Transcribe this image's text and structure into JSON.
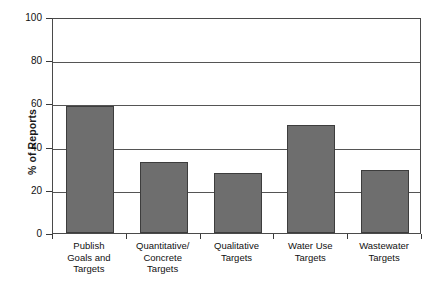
{
  "chart_data": {
    "type": "bar",
    "title": "",
    "xlabel": "",
    "ylabel": "% of Reports",
    "categories": [
      "Publish Goals and Targets",
      "Quantitative/ Concrete Targets",
      "Qualitative Targets",
      "Water Use Targets",
      "Wastewater Targets"
    ],
    "category_lines": [
      [
        "Publish",
        "Goals and",
        "Targets"
      ],
      [
        "Quantitative/",
        "Concrete",
        "Targets"
      ],
      [
        "Qualitative",
        "Targets"
      ],
      [
        "Water Use",
        "Targets"
      ],
      [
        "Wastewater",
        "Targets"
      ]
    ],
    "values": [
      59,
      33,
      28,
      50,
      29
    ],
    "ylim": [
      0,
      100
    ],
    "yticks": [
      0,
      20,
      40,
      60,
      80,
      100
    ],
    "ytick_labels": [
      "0",
      "20",
      "40",
      "60",
      "80",
      "100"
    ],
    "grid": true,
    "legend": "none",
    "bar_color": "#6e6e6e",
    "bar_edge_color": "#3d3d3d",
    "axis_color": "#4a4a4a"
  }
}
